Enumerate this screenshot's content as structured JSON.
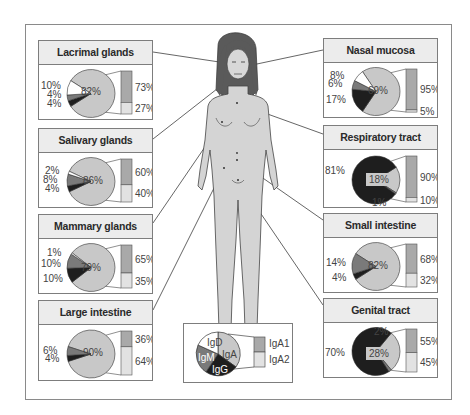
{
  "figure": {
    "colors": {
      "IgA": "#c8c8c8",
      "IgM": "#7a7a7a",
      "IgG": "#1e1e1e",
      "IgD": "#ffffff",
      "IgA1": "#a9a9a9",
      "IgA2": "#e2e2e2",
      "title_bg": "#ececec",
      "body_fill": "#d4d4d4",
      "hair": "#555555"
    },
    "legend": {
      "pie_labels": [
        "IgD",
        "IgA",
        "IgM",
        "IgG"
      ],
      "bar_labels": [
        "IgA1",
        "IgA2"
      ]
    },
    "panels": [
      {
        "id": "lacrimal",
        "title": "Lacrimal glands",
        "IgA": "82%",
        "IgD": "10%",
        "IgM": "4%",
        "IgG": "4%",
        "IgA1": "73%",
        "IgA2": "27%"
      },
      {
        "id": "salivary",
        "title": "Salivary glands",
        "IgA": "86%",
        "IgD": "2%",
        "IgM": "8%",
        "IgG": "4%",
        "IgA1": "60%",
        "IgA2": "40%"
      },
      {
        "id": "mammary",
        "title": "Mammary glands",
        "IgA": "79%",
        "IgD": "1%",
        "IgM": "10%",
        "IgG": "10%",
        "IgA1": "65%",
        "IgA2": "35%"
      },
      {
        "id": "large-intestine",
        "title": "Large intestine",
        "IgA": "90%",
        "IgM": "6%",
        "IgG": "4%",
        "IgA1": "36%",
        "IgA2": "64%"
      },
      {
        "id": "nasal",
        "title": "Nasal mucosa",
        "IgA": "69%",
        "IgD": "8%",
        "IgM": "6%",
        "IgG": "17%",
        "IgA1": "95%",
        "IgA2": "5%"
      },
      {
        "id": "respiratory",
        "title": "Respiratory tract",
        "IgA": "18%",
        "IgG": "81%",
        "IgM": "1%",
        "IgA1": "90%",
        "IgA2": "10%"
      },
      {
        "id": "small-intestine",
        "title": "Small intestine",
        "IgA": "82%",
        "IgM": "14%",
        "IgG": "4%",
        "IgA1": "68%",
        "IgA2": "32%"
      },
      {
        "id": "genital",
        "title": "Genital tract",
        "IgA": "28%",
        "IgG": "70%",
        "IgM": "2%",
        "IgA1": "55%",
        "IgA2": "45%"
      }
    ]
  },
  "chart_data": [
    {
      "type": "pie",
      "title": "Lacrimal glands",
      "categories": [
        "IgA",
        "IgD",
        "IgM",
        "IgG"
      ],
      "values": [
        82,
        10,
        4,
        4
      ],
      "subbar": {
        "categories": [
          "IgA1",
          "IgA2"
        ],
        "values": [
          73,
          27
        ]
      }
    },
    {
      "type": "pie",
      "title": "Salivary glands",
      "categories": [
        "IgA",
        "IgD",
        "IgM",
        "IgG"
      ],
      "values": [
        86,
        2,
        8,
        4
      ],
      "subbar": {
        "categories": [
          "IgA1",
          "IgA2"
        ],
        "values": [
          60,
          40
        ]
      }
    },
    {
      "type": "pie",
      "title": "Mammary glands",
      "categories": [
        "IgA",
        "IgD",
        "IgM",
        "IgG"
      ],
      "values": [
        79,
        1,
        10,
        10
      ],
      "subbar": {
        "categories": [
          "IgA1",
          "IgA2"
        ],
        "values": [
          65,
          35
        ]
      }
    },
    {
      "type": "pie",
      "title": "Large intestine",
      "categories": [
        "IgA",
        "IgM",
        "IgG"
      ],
      "values": [
        90,
        6,
        4
      ],
      "subbar": {
        "categories": [
          "IgA1",
          "IgA2"
        ],
        "values": [
          36,
          64
        ]
      }
    },
    {
      "type": "pie",
      "title": "Nasal mucosa",
      "categories": [
        "IgA",
        "IgD",
        "IgM",
        "IgG"
      ],
      "values": [
        69,
        8,
        6,
        17
      ],
      "subbar": {
        "categories": [
          "IgA1",
          "IgA2"
        ],
        "values": [
          95,
          5
        ]
      }
    },
    {
      "type": "pie",
      "title": "Respiratory tract",
      "categories": [
        "IgA",
        "IgG",
        "IgM"
      ],
      "values": [
        18,
        81,
        1
      ],
      "subbar": {
        "categories": [
          "IgA1",
          "IgA2"
        ],
        "values": [
          90,
          10
        ]
      }
    },
    {
      "type": "pie",
      "title": "Small intestine",
      "categories": [
        "IgA",
        "IgM",
        "IgG"
      ],
      "values": [
        82,
        14,
        4
      ],
      "subbar": {
        "categories": [
          "IgA1",
          "IgA2"
        ],
        "values": [
          68,
          32
        ]
      }
    },
    {
      "type": "pie",
      "title": "Genital tract",
      "categories": [
        "IgA",
        "IgG",
        "IgM"
      ],
      "values": [
        28,
        70,
        2
      ],
      "subbar": {
        "categories": [
          "IgA1",
          "IgA2"
        ],
        "values": [
          55,
          45
        ]
      }
    }
  ]
}
